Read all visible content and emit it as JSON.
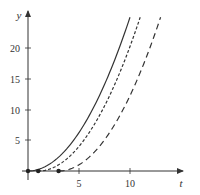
{
  "chart_data": {
    "type": "line",
    "title": "",
    "xlabel": "t",
    "ylabel": "y",
    "xlim": [
      0,
      16.5
    ],
    "ylim": [
      0,
      26
    ],
    "x_ticks": [
      5,
      10
    ],
    "y_ticks": [
      5,
      10,
      15,
      20
    ],
    "grid": false,
    "legend": null,
    "series": [
      {
        "name": "y = 0.25 t^2",
        "style": "solid",
        "start_t": 0,
        "end_t": 10,
        "formula_shift": 0,
        "coef": 0.25,
        "x": [
          0,
          1,
          2,
          3,
          4,
          5,
          6,
          7,
          8,
          9,
          10
        ],
        "values": [
          0,
          0.25,
          1,
          2.25,
          4,
          6.25,
          9,
          12.25,
          16,
          20.25,
          25
        ]
      },
      {
        "name": "y = 0.25 (t-1)^2",
        "style": "short-dash",
        "start_t": 1,
        "end_t": 11,
        "formula_shift": 1,
        "coef": 0.25,
        "x": [
          1,
          2,
          3,
          4,
          5,
          6,
          7,
          8,
          9,
          10,
          11
        ],
        "values": [
          0,
          0.25,
          1,
          2.25,
          4,
          6.25,
          9,
          12.25,
          16,
          20.25,
          25
        ]
      },
      {
        "name": "y = 0.25 (t-3)^2",
        "style": "long-dash",
        "start_t": 3,
        "end_t": 13,
        "formula_shift": 3,
        "coef": 0.25,
        "x": [
          3,
          4,
          5,
          6,
          7,
          8,
          9,
          10,
          11,
          12,
          13
        ],
        "values": [
          0,
          0.25,
          1,
          2.25,
          4,
          6.25,
          9,
          12.25,
          16,
          20.25,
          25
        ]
      }
    ],
    "points": [
      {
        "t": 0,
        "y": 0
      },
      {
        "t": 1,
        "y": 0
      },
      {
        "t": 3,
        "y": 0
      }
    ]
  },
  "labels": {
    "x_axis": "t",
    "y_axis": "y",
    "x_tick_5": "5",
    "x_tick_10": "10",
    "y_tick_5": "5",
    "y_tick_10": "10",
    "y_tick_15": "15",
    "y_tick_20": "20"
  },
  "colors": {
    "axis": "#333333",
    "curve": "#333333"
  }
}
